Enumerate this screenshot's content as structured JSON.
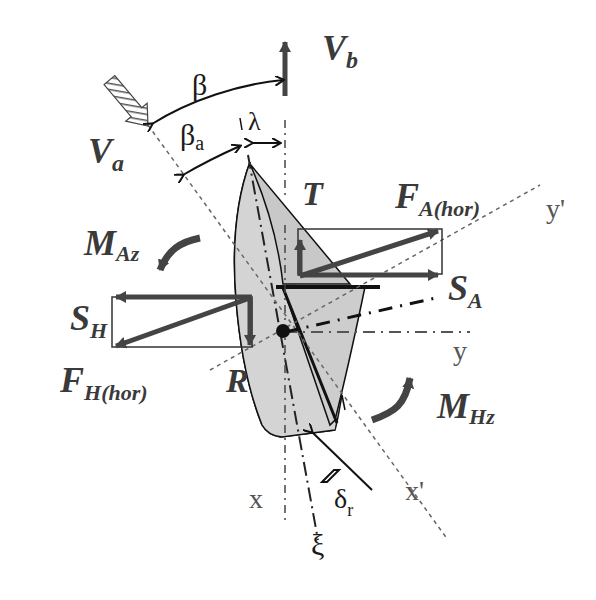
{
  "diagram": {
    "colors": {
      "hull_fill": "#d4d4d4",
      "sail_fill": "#c4c4c4",
      "force_arrow": "#444444",
      "outline": "#111111",
      "axis_dash": "#666666",
      "label": "#3a3a3a"
    },
    "labels": {
      "boat_velocity": "V",
      "boat_velocity_sub": "b",
      "apparent_wind": "V",
      "apparent_wind_sub": "a",
      "beta": "β",
      "beta_a": "β",
      "beta_a_sub": "a",
      "lambda": "λ",
      "thrust": "T",
      "aero_force": "F",
      "aero_force_sub": "A(hor)",
      "aero_side": "S",
      "aero_side_sub": "A",
      "aero_moment": "M",
      "aero_moment_sub": "Az",
      "hydro_side": "S",
      "hydro_side_sub": "H",
      "hydro_force": "F",
      "hydro_force_sub": "H(hor)",
      "resistance": "R",
      "hydro_moment": "M",
      "hydro_moment_sub": "Hz",
      "axis_x": "x",
      "axis_y": "y",
      "axis_x_prime": "x'",
      "axis_y_prime": "y'",
      "axis_xi": "ξ",
      "rudder_angle": "δ",
      "rudder_angle_sub": "r"
    }
  }
}
